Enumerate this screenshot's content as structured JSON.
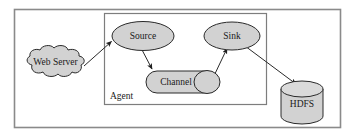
{
  "diagram": {
    "type": "flow-diagram",
    "background_color": "#ffffff",
    "frames": [
      {
        "id": "outer-frame",
        "name": "outer-border",
        "label": "",
        "stroke_color": "#8a8a8a"
      },
      {
        "id": "agent-box",
        "name": "agent-container",
        "label": "Agent",
        "stroke_color": "#7d7d7d"
      }
    ],
    "nodes": [
      {
        "id": "webserver",
        "label": "Web Server",
        "shape": "cloud",
        "fill": "#d2d2d2",
        "stroke": "#2a2a2a"
      },
      {
        "id": "source",
        "label": "Source",
        "shape": "ellipse",
        "fill": "#d2d2d2",
        "stroke": "#2a2a2a"
      },
      {
        "id": "channel",
        "label": "Channel",
        "shape": "stadium-with-cap",
        "fill": "#d2d2d2",
        "stroke": "#2a2a2a"
      },
      {
        "id": "sink",
        "label": "Sink",
        "shape": "ellipse",
        "fill": "#d2d2d2",
        "stroke": "#2a2a2a"
      },
      {
        "id": "hdfs",
        "label": "HDFS",
        "shape": "cylinder",
        "fill": "#d2d2d2",
        "stroke": "#2a2a2a"
      }
    ],
    "edges": [
      {
        "id": "e1",
        "from": "webserver",
        "to": "source",
        "arrow": true
      },
      {
        "id": "e2",
        "from": "source",
        "to": "channel",
        "arrow": true
      },
      {
        "id": "e3",
        "from": "channel",
        "to": "sink",
        "arrow": true
      },
      {
        "id": "e4",
        "from": "sink",
        "to": "hdfs",
        "arrow": true
      }
    ]
  }
}
